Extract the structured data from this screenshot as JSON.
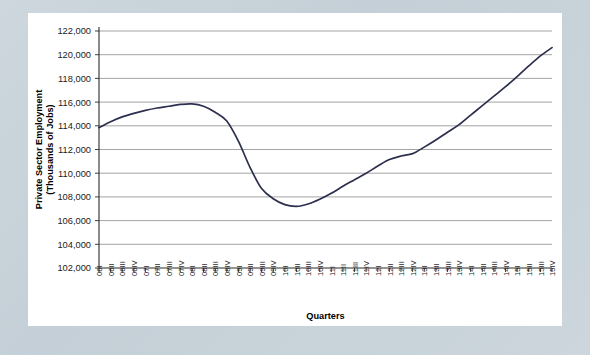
{
  "chart_data": {
    "type": "line",
    "title": "",
    "xlabel": "Quarters",
    "ylabel": "Private Sector Employment\n(Thousands of Jobs)",
    "ylabel_line1": "Private Sector Employment",
    "ylabel_line2": "(Thousands of Jobs)",
    "ylim": [
      102000,
      122000
    ],
    "ytick_step": 2000,
    "grid": true,
    "legend": "none",
    "line_color": "#2c2f4d",
    "categories": [
      "06I",
      "06II",
      "06III",
      "06IV",
      "07I",
      "07II",
      "07III",
      "07IV",
      "08I",
      "08II",
      "08III",
      "08IV",
      "09I",
      "09II",
      "09III",
      "09IV",
      "10I",
      "10II",
      "10III",
      "10IV",
      "11I",
      "11II",
      "11III",
      "11IV",
      "12I",
      "12II",
      "12III",
      "12IV",
      "13I",
      "13II",
      "13III",
      "13IV",
      "14I",
      "14II",
      "14III",
      "14IV",
      "15I",
      "15II",
      "15III",
      "15IV"
    ],
    "ytick_labels": [
      "102,000",
      "104,000",
      "106,000",
      "108,000",
      "110,000",
      "112,000",
      "114,000",
      "116,000",
      "118,000",
      "120,000",
      "122,000"
    ],
    "ytick_values": [
      102000,
      104000,
      106000,
      108000,
      110000,
      112000,
      114000,
      116000,
      118000,
      120000,
      122000
    ],
    "series": [
      {
        "name": "Private Sector Employment",
        "values": [
          113850,
          114350,
          114750,
          115050,
          115300,
          115500,
          115650,
          115800,
          115850,
          115650,
          115150,
          114400,
          112700,
          110500,
          108700,
          107850,
          107350,
          107200,
          107400,
          107800,
          108300,
          108900,
          109450,
          110000,
          110600,
          111150,
          111450,
          111650,
          112200,
          112800,
          113450,
          114100,
          114900,
          115700,
          116500,
          117300,
          118150,
          119050,
          119900,
          120600
        ]
      }
    ]
  }
}
